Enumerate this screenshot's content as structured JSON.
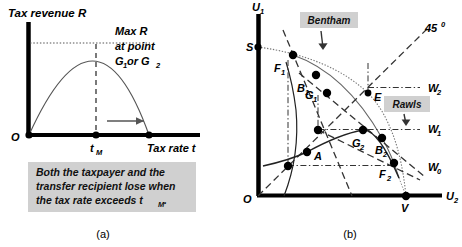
{
  "figure": {
    "panel_a": {
      "caption": "(a)",
      "y_axis_label": "Tax revenue R",
      "x_axis_label": "Tax rate t",
      "origin_label": "O",
      "tick_label": "t",
      "tick_sub": "M",
      "annotation_line1": "Max R",
      "annotation_line2": "at point",
      "annotation_line3_pre": "G",
      "annotation_line3_sub1": "1",
      "annotation_line3_mid": " or G",
      "annotation_line3_sub2": "2",
      "note_line1": "Both the taxpayer and the",
      "note_line2": "transfer recipient lose when",
      "note_line3_pre": "the tax rate exceeds t",
      "note_line3_sub": "M",
      "note_line3_post": ".",
      "note_bg_color": "#d0d0d0",
      "curve_color": "#444444",
      "axis_color": "#000000"
    },
    "panel_b": {
      "caption": "(b)",
      "y_axis_label_pre": "U",
      "y_axis_label_sub": "1",
      "x_axis_label_pre": "U",
      "x_axis_label_sub": "2",
      "origin_label": "O",
      "bentham_label": "Bentham",
      "rawls_label": "Rawls",
      "line45_label_pre": "45",
      "line45_label_sup": "0",
      "box_bg_color": "#d0d0d0",
      "points": [
        {
          "name": "S",
          "label_pre": "S",
          "label_sub": "",
          "x": 258,
          "y": 47,
          "lx": 247,
          "ly": 45,
          "dot": true
        },
        {
          "name": "F1",
          "label_pre": "F",
          "label_sub": "1",
          "x": 293,
          "y": 55,
          "lx": 275,
          "ly": 68,
          "dot": true
        },
        {
          "name": "B1",
          "label_pre": "B",
          "label_sub": "1",
          "x": 316,
          "y": 75,
          "lx": 298,
          "ly": 88,
          "dot": true
        },
        {
          "name": "G1",
          "label_pre": "G",
          "label_sub": "1",
          "x": 327,
          "y": 93,
          "lx": 307,
          "ly": 99,
          "dot": true
        },
        {
          "name": "E",
          "label_pre": "E",
          "label_sub": "",
          "x": 368,
          "y": 93,
          "lx": 375,
          "ly": 99,
          "dot": true
        },
        {
          "name": "U1",
          "label_pre": "",
          "label_sub": "",
          "x": 318,
          "y": 130,
          "lx": 0,
          "ly": 0,
          "dot": true
        },
        {
          "name": "G2",
          "label_pre": "G",
          "label_sub": "2",
          "x": 363,
          "y": 130,
          "lx": 353,
          "ly": 146,
          "dot": true
        },
        {
          "name": "B2",
          "label_pre": "B",
          "label_sub": "2",
          "x": 382,
          "y": 138,
          "lx": 377,
          "ly": 152,
          "dot": true
        },
        {
          "name": "A",
          "label_pre": "A",
          "label_sub": "",
          "x": 307,
          "y": 152,
          "lx": 315,
          "ly": 159,
          "dot": true
        },
        {
          "name": "U0",
          "label_pre": "",
          "label_sub": "",
          "x": 288,
          "y": 166,
          "lx": 0,
          "ly": 0,
          "dot": true
        },
        {
          "name": "F2",
          "label_pre": "F",
          "label_sub": "2",
          "x": 394,
          "y": 163,
          "lx": 381,
          "ly": 177,
          "dot": true
        },
        {
          "name": "V",
          "label_pre": "V",
          "label_sub": "",
          "x": 406,
          "y": 196,
          "lx": 402,
          "ly": 212,
          "dot": true
        }
      ],
      "w_labels": [
        {
          "name": "W2",
          "pre": "W",
          "sub": "2",
          "x": 428,
          "y": 88
        },
        {
          "name": "W1",
          "pre": "W",
          "sub": "1",
          "x": 428,
          "y": 129
        },
        {
          "name": "W0",
          "pre": "W",
          "sub": "0",
          "x": 428,
          "y": 167
        }
      ]
    }
  }
}
